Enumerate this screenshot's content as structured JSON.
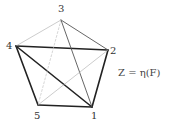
{
  "graph": {
    "vertices": [
      {
        "id": "1",
        "label": "1"
      },
      {
        "id": "2",
        "label": "2"
      },
      {
        "id": "3",
        "label": "3"
      },
      {
        "id": "4",
        "label": "4"
      },
      {
        "id": "5",
        "label": "5"
      }
    ],
    "edges": [
      {
        "from": "4",
        "to": "5",
        "weight": "thick"
      },
      {
        "from": "5",
        "to": "1",
        "weight": "thick"
      },
      {
        "from": "1",
        "to": "2",
        "weight": "thick"
      },
      {
        "from": "4",
        "to": "2",
        "weight": "thick"
      },
      {
        "from": "4",
        "to": "1",
        "weight": "thick"
      },
      {
        "from": "3",
        "to": "2",
        "weight": "medium"
      },
      {
        "from": "3",
        "to": "1",
        "weight": "medium"
      },
      {
        "from": "3",
        "to": "4",
        "weight": "thin"
      },
      {
        "from": "2",
        "to": "5",
        "weight": "thin"
      },
      {
        "from": "3",
        "to": "5",
        "weight": "dotted"
      }
    ],
    "colors": {
      "thick": "#222222",
      "medium": "#555555",
      "thin": "#aaaaaa",
      "dotted": "#bbbbbb"
    }
  },
  "formula": "Z = η(F)"
}
